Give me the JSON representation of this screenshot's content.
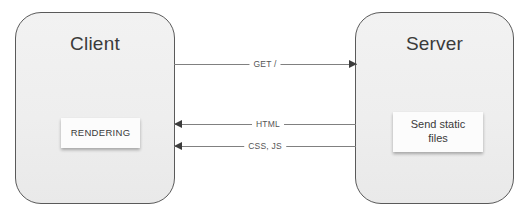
{
  "diagram": {
    "nodes": [
      {
        "id": "client",
        "label": "Client",
        "inner_card": "RENDERING"
      },
      {
        "id": "server",
        "label": "Server",
        "inner_card_line1": "Send static",
        "inner_card_line2": "files"
      }
    ],
    "connectors": [
      {
        "id": "get",
        "label": "GET /",
        "direction": "client-to-server"
      },
      {
        "id": "html",
        "label": "HTML",
        "direction": "server-to-client"
      },
      {
        "id": "cssjs",
        "label": "CSS, JS",
        "direction": "server-to-client"
      }
    ],
    "colors": {
      "box_fill": "#eeeeee",
      "box_border": "#5a5a5a",
      "card_fill": "#fcfcfc",
      "line": "#808080",
      "arrow": "#3c3c3c",
      "text": "#3a3a3a",
      "label_text": "#555555",
      "background": "#ffffff"
    }
  }
}
